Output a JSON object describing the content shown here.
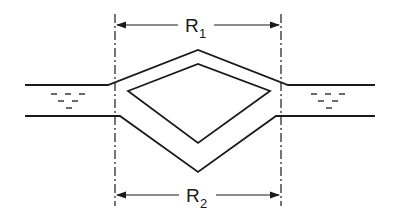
{
  "diagram": {
    "type": "channel-bifurcation-loop",
    "labels": {
      "top_dimension": {
        "main": "R",
        "sub": "1"
      },
      "bottom_dimension": {
        "main": "R",
        "sub": "2"
      }
    },
    "colors": {
      "line": "#1a1a1a",
      "background": "#ffffff"
    }
  }
}
